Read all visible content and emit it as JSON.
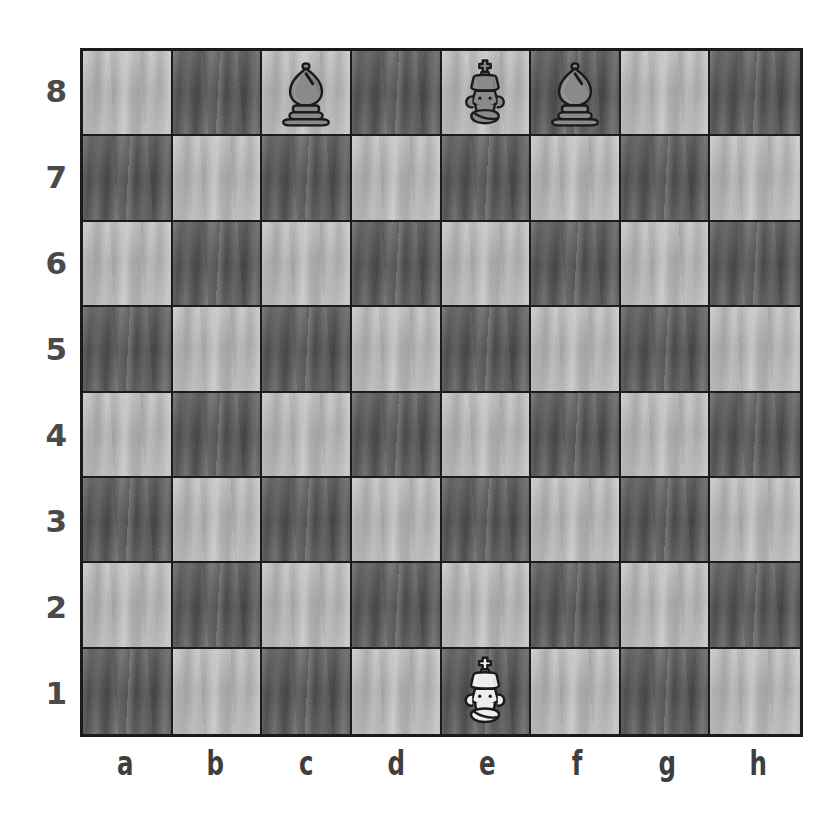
{
  "board": {
    "title": "Chess position diagram",
    "files": [
      "a",
      "b",
      "c",
      "d",
      "e",
      "f",
      "g",
      "h"
    ],
    "ranks": [
      "8",
      "7",
      "6",
      "5",
      "4",
      "3",
      "2",
      "1"
    ],
    "orientation": "white-bottom",
    "colors": {
      "light_square": "#b6b6b6",
      "dark_square": "#636363",
      "border": "#1b1b1b",
      "label_text": "#4a4a4a",
      "white_piece_fill": "#eeeeee",
      "black_piece_fill": "#8a8a8a",
      "piece_outline": "#1a1a1a",
      "page_background": "#ffffff"
    },
    "squares": [
      {
        "id": "a8",
        "file": "a",
        "rank": "8",
        "shade": "light",
        "piece": null
      },
      {
        "id": "b8",
        "file": "b",
        "rank": "8",
        "shade": "dark",
        "piece": null
      },
      {
        "id": "c8",
        "file": "c",
        "rank": "8",
        "shade": "light",
        "piece": {
          "type": "bishop",
          "color": "black",
          "name": "black-bishop"
        }
      },
      {
        "id": "d8",
        "file": "d",
        "rank": "8",
        "shade": "dark",
        "piece": null
      },
      {
        "id": "e8",
        "file": "e",
        "rank": "8",
        "shade": "light",
        "piece": {
          "type": "king",
          "color": "black",
          "name": "black-king"
        }
      },
      {
        "id": "f8",
        "file": "f",
        "rank": "8",
        "shade": "dark",
        "piece": {
          "type": "bishop",
          "color": "black",
          "name": "black-bishop"
        }
      },
      {
        "id": "g8",
        "file": "g",
        "rank": "8",
        "shade": "light",
        "piece": null
      },
      {
        "id": "h8",
        "file": "h",
        "rank": "8",
        "shade": "dark",
        "piece": null
      },
      {
        "id": "a7",
        "file": "a",
        "rank": "7",
        "shade": "dark",
        "piece": null
      },
      {
        "id": "b7",
        "file": "b",
        "rank": "7",
        "shade": "light",
        "piece": null
      },
      {
        "id": "c7",
        "file": "c",
        "rank": "7",
        "shade": "dark",
        "piece": null
      },
      {
        "id": "d7",
        "file": "d",
        "rank": "7",
        "shade": "light",
        "piece": null
      },
      {
        "id": "e7",
        "file": "e",
        "rank": "7",
        "shade": "dark",
        "piece": null
      },
      {
        "id": "f7",
        "file": "f",
        "rank": "7",
        "shade": "light",
        "piece": null
      },
      {
        "id": "g7",
        "file": "g",
        "rank": "7",
        "shade": "dark",
        "piece": null
      },
      {
        "id": "h7",
        "file": "h",
        "rank": "7",
        "shade": "light",
        "piece": null
      },
      {
        "id": "a6",
        "file": "a",
        "rank": "6",
        "shade": "light",
        "piece": null
      },
      {
        "id": "b6",
        "file": "b",
        "rank": "6",
        "shade": "dark",
        "piece": null
      },
      {
        "id": "c6",
        "file": "c",
        "rank": "6",
        "shade": "light",
        "piece": null
      },
      {
        "id": "d6",
        "file": "d",
        "rank": "6",
        "shade": "dark",
        "piece": null
      },
      {
        "id": "e6",
        "file": "e",
        "rank": "6",
        "shade": "light",
        "piece": null
      },
      {
        "id": "f6",
        "file": "f",
        "rank": "6",
        "shade": "dark",
        "piece": null
      },
      {
        "id": "g6",
        "file": "g",
        "rank": "6",
        "shade": "light",
        "piece": null
      },
      {
        "id": "h6",
        "file": "h",
        "rank": "6",
        "shade": "dark",
        "piece": null
      },
      {
        "id": "a5",
        "file": "a",
        "rank": "5",
        "shade": "dark",
        "piece": null
      },
      {
        "id": "b5",
        "file": "b",
        "rank": "5",
        "shade": "light",
        "piece": null
      },
      {
        "id": "c5",
        "file": "c",
        "rank": "5",
        "shade": "dark",
        "piece": null
      },
      {
        "id": "d5",
        "file": "d",
        "rank": "5",
        "shade": "light",
        "piece": null
      },
      {
        "id": "e5",
        "file": "e",
        "rank": "5",
        "shade": "dark",
        "piece": null
      },
      {
        "id": "f5",
        "file": "f",
        "rank": "5",
        "shade": "light",
        "piece": null
      },
      {
        "id": "g5",
        "file": "g",
        "rank": "5",
        "shade": "dark",
        "piece": null
      },
      {
        "id": "h5",
        "file": "h",
        "rank": "5",
        "shade": "light",
        "piece": null
      },
      {
        "id": "a4",
        "file": "a",
        "rank": "4",
        "shade": "light",
        "piece": null
      },
      {
        "id": "b4",
        "file": "b",
        "rank": "4",
        "shade": "dark",
        "piece": null
      },
      {
        "id": "c4",
        "file": "c",
        "rank": "4",
        "shade": "light",
        "piece": null
      },
      {
        "id": "d4",
        "file": "d",
        "rank": "4",
        "shade": "dark",
        "piece": null
      },
      {
        "id": "e4",
        "file": "e",
        "rank": "4",
        "shade": "light",
        "piece": null
      },
      {
        "id": "f4",
        "file": "f",
        "rank": "4",
        "shade": "dark",
        "piece": null
      },
      {
        "id": "g4",
        "file": "g",
        "rank": "4",
        "shade": "light",
        "piece": null
      },
      {
        "id": "h4",
        "file": "h",
        "rank": "4",
        "shade": "dark",
        "piece": null
      },
      {
        "id": "a3",
        "file": "a",
        "rank": "3",
        "shade": "dark",
        "piece": null
      },
      {
        "id": "b3",
        "file": "b",
        "rank": "3",
        "shade": "light",
        "piece": null
      },
      {
        "id": "c3",
        "file": "c",
        "rank": "3",
        "shade": "dark",
        "piece": null
      },
      {
        "id": "d3",
        "file": "d",
        "rank": "3",
        "shade": "light",
        "piece": null
      },
      {
        "id": "e3",
        "file": "e",
        "rank": "3",
        "shade": "dark",
        "piece": null
      },
      {
        "id": "f3",
        "file": "f",
        "rank": "3",
        "shade": "light",
        "piece": null
      },
      {
        "id": "g3",
        "file": "g",
        "rank": "3",
        "shade": "dark",
        "piece": null
      },
      {
        "id": "h3",
        "file": "h",
        "rank": "3",
        "shade": "light",
        "piece": null
      },
      {
        "id": "a2",
        "file": "a",
        "rank": "2",
        "shade": "light",
        "piece": null
      },
      {
        "id": "b2",
        "file": "b",
        "rank": "2",
        "shade": "dark",
        "piece": null
      },
      {
        "id": "c2",
        "file": "c",
        "rank": "2",
        "shade": "light",
        "piece": null
      },
      {
        "id": "d2",
        "file": "d",
        "rank": "2",
        "shade": "dark",
        "piece": null
      },
      {
        "id": "e2",
        "file": "e",
        "rank": "2",
        "shade": "light",
        "piece": null
      },
      {
        "id": "f2",
        "file": "f",
        "rank": "2",
        "shade": "dark",
        "piece": null
      },
      {
        "id": "g2",
        "file": "g",
        "rank": "2",
        "shade": "light",
        "piece": null
      },
      {
        "id": "h2",
        "file": "h",
        "rank": "2",
        "shade": "dark",
        "piece": null
      },
      {
        "id": "a1",
        "file": "a",
        "rank": "1",
        "shade": "dark",
        "piece": null
      },
      {
        "id": "b1",
        "file": "b",
        "rank": "1",
        "shade": "light",
        "piece": null
      },
      {
        "id": "c1",
        "file": "c",
        "rank": "1",
        "shade": "dark",
        "piece": null
      },
      {
        "id": "d1",
        "file": "d",
        "rank": "1",
        "shade": "light",
        "piece": null
      },
      {
        "id": "e1",
        "file": "e",
        "rank": "1",
        "shade": "dark",
        "piece": {
          "type": "king",
          "color": "white",
          "name": "white-king"
        }
      },
      {
        "id": "f1",
        "file": "f",
        "rank": "1",
        "shade": "light",
        "piece": null
      },
      {
        "id": "g1",
        "file": "g",
        "rank": "1",
        "shade": "dark",
        "piece": null
      },
      {
        "id": "h1",
        "file": "h",
        "rank": "1",
        "shade": "light",
        "piece": null
      }
    ]
  }
}
